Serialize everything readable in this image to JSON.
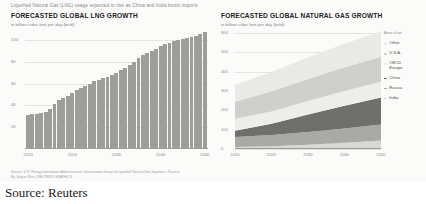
{
  "kicker": "Liquefied Natural Gas (LNG) usage expected to rise as China and India boost imports",
  "caption": "Source: Reuters",
  "source_note_line1": "Source: U.S. Energy Information Administration, International Group of Liquefied Natural Gas Importers, Reuters",
  "source_note_line2": "By Jahyun Shin  |  REUTERS GRAPHICS",
  "legend": {
    "note": "Area chart",
    "items": [
      {
        "label": "Other",
        "color": "#e9e9e6"
      },
      {
        "label": "U.S.A.",
        "color": "#cfcfcb"
      },
      {
        "label": "OECD\nEurope",
        "color": "#ededea"
      },
      {
        "label": "China",
        "color": "#6f6f6d"
      },
      {
        "label": "Russia",
        "color": "#a9a9a6"
      },
      {
        "label": "India",
        "color": "#d8d8d4"
      }
    ]
  },
  "chart_data": [
    {
      "type": "bar",
      "title": "FORECASTED GLOBAL LNG GROWTH",
      "subtitle": "in billion cubic feet per day (bcfd)",
      "xlabel": "",
      "ylabel": "",
      "ylim": [
        0,
        110
      ],
      "yticks": [
        100,
        80,
        60,
        40,
        20
      ],
      "xticks": [
        "2010",
        "2020",
        "2030",
        "2040",
        "2050"
      ],
      "grid": true,
      "bar_color": "#9d9d9b",
      "x": [
        2010,
        2011,
        2012,
        2013,
        2014,
        2015,
        2016,
        2017,
        2018,
        2019,
        2020,
        2021,
        2022,
        2023,
        2024,
        2025,
        2026,
        2027,
        2028,
        2029,
        2030,
        2031,
        2032,
        2033,
        2034,
        2035,
        2036,
        2037,
        2038,
        2039,
        2040,
        2041,
        2042,
        2043,
        2044,
        2045,
        2046,
        2047,
        2048,
        2049,
        2050
      ],
      "values": [
        31,
        32,
        32,
        33,
        34,
        37,
        41,
        45,
        47,
        49,
        51,
        54,
        56,
        58,
        60,
        62,
        63,
        65,
        66,
        68,
        70,
        72,
        74,
        77,
        80,
        83,
        86,
        88,
        90,
        92,
        94,
        96,
        97,
        99,
        100,
        101,
        102,
        103,
        104,
        105,
        107
      ]
    },
    {
      "type": "area",
      "title": "FORECASTED GLOBAL NATURAL GAS GROWTH",
      "subtitle": "in billion cubic feet per day (bcfd)",
      "xlabel": "",
      "ylabel": "",
      "ylim": [
        0,
        620
      ],
      "yticks": [
        600,
        500,
        400,
        300,
        200,
        100,
        0
      ],
      "xticks": [
        "2010",
        "2020",
        "2030",
        "2040",
        "2050"
      ],
      "grid": true,
      "stacked": true,
      "x": [
        2010,
        2020,
        2030,
        2040,
        2050
      ],
      "series": [
        {
          "name": "India",
          "color": "#d8d8d4",
          "values": [
            10,
            14,
            22,
            32,
            44
          ]
        },
        {
          "name": "Russia",
          "color": "#a9a9a6",
          "values": [
            52,
            58,
            66,
            74,
            82
          ]
        },
        {
          "name": "China",
          "color": "#6f6f6d",
          "values": [
            32,
            58,
            90,
            118,
            140
          ]
        },
        {
          "name": "OECD Europe",
          "color": "#ededea",
          "values": [
            62,
            64,
            70,
            76,
            82
          ]
        },
        {
          "name": "U.S.A.",
          "color": "#cfcfcb",
          "values": [
            88,
            104,
            114,
            122,
            128
          ]
        },
        {
          "name": "Other",
          "color": "#e9e9e6",
          "values": [
            88,
            100,
            112,
            122,
            132
          ]
        }
      ]
    }
  ]
}
